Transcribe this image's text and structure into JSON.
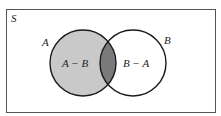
{
  "diagram": {
    "type": "venn",
    "universe_label": "S",
    "sets": [
      {
        "name": "A",
        "label": "A",
        "cx": 83,
        "cy": 63,
        "r": 33
      },
      {
        "name": "B",
        "label": "B",
        "cx": 133,
        "cy": 63,
        "r": 33
      }
    ],
    "regions": {
      "a_minus_b": {
        "label": "A − B",
        "fill": "#c9c9c9"
      },
      "intersection": {
        "fill": "#7a7a7a"
      },
      "b_minus_a": {
        "label": "B − A",
        "fill": "#ffffff"
      }
    },
    "colors": {
      "stroke": "#1a1a1a",
      "frame": "#555555",
      "background": "#ffffff"
    }
  }
}
